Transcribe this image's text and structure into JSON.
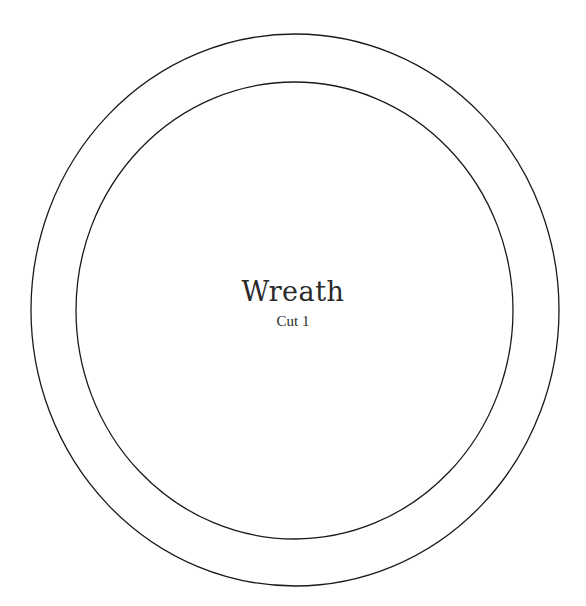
{
  "template": {
    "title": "Wreath",
    "subtitle": "Cut 1",
    "stroke_color": "#1a1a1a",
    "background": "#ffffff",
    "outer_ring": {
      "cx": 295,
      "cy": 310,
      "rx": 264,
      "ry": 276
    },
    "inner_ring": {
      "cx": 294.5,
      "cy": 310.5,
      "rx": 218.5,
      "ry": 228.5
    }
  }
}
